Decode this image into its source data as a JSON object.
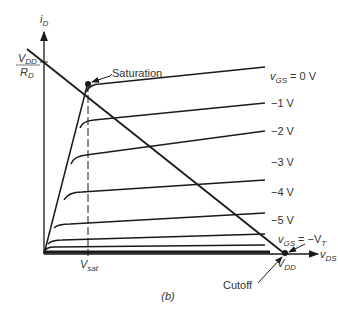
{
  "figure": {
    "caption": "(b)",
    "y_axis_label": "i",
    "y_axis_sub": "D",
    "x_axis_label": "v",
    "x_axis_sub": "DS",
    "y_intercept_num": "V",
    "y_intercept_num_sub": "DD",
    "y_intercept_den": "R",
    "y_intercept_den_sub": "D",
    "x_intercept": "V",
    "x_intercept_sub": "DD",
    "vsat": "V",
    "vsat_sub": "sat",
    "saturation_label": "Saturation",
    "cutoff_label": "Cutoff",
    "curves": [
      {
        "label_prefix": "v",
        "label_sub": "GS",
        "label_value": " = 0 V"
      },
      {
        "label_value": "−1 V"
      },
      {
        "label_value": "−2 V"
      },
      {
        "label_value": "−3 V"
      },
      {
        "label_value": "−4 V"
      },
      {
        "label_value": "−5 V"
      },
      {
        "label_prefix": "v",
        "label_sub": "GS",
        "label_value": " = −V",
        "label_value_sub": "T"
      }
    ],
    "colors": {
      "line": "#1a1a1a",
      "text": "#333333",
      "background": "#ffffff"
    }
  }
}
